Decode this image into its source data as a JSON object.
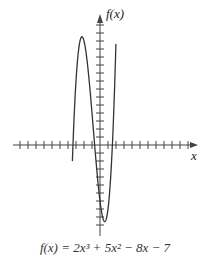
{
  "chart_data": {
    "type": "line",
    "title": "",
    "caption": "f(x) = 2x³ + 5x² − 8x − 7",
    "function": "2x^3 + 5x^2 - 8x - 7",
    "xlabel": "x",
    "ylabel": "f(x)",
    "xlim": [
      -11,
      12
    ],
    "ylim": [
      -11,
      16
    ],
    "tick_spacing_x": 1,
    "tick_spacing_y": 1,
    "tick_labels": false,
    "grid": false,
    "legend": null,
    "key_points": {
      "local_max": {
        "x": -2.26,
        "y": 13.5
      },
      "local_min": {
        "x": 0.59,
        "y": -9.57
      },
      "roots": [
        -3.38,
        -0.67,
        1.55
      ]
    },
    "series": [
      {
        "name": "f(x)",
        "color": "#333333",
        "x": [
          -3.6,
          -3.4,
          -3.0,
          -2.5,
          -2.26,
          -2.0,
          -1.5,
          -1.0,
          -0.5,
          0.0,
          0.5,
          0.59,
          1.0,
          1.5,
          1.9,
          2.0
        ],
        "y": [
          -5.43,
          -0.6,
          8.0,
          13.0,
          13.5,
          13.0,
          9.5,
          4.0,
          -2.5,
          -7.0,
          -9.5,
          -9.57,
          -8.0,
          -1.0,
          7.9,
          9.0
        ]
      }
    ]
  },
  "labels": {
    "y_axis": "f(x)",
    "x_axis": "x",
    "caption": "f(x) = 2x³ + 5x² − 8x − 7"
  },
  "colors": {
    "axis": "#444444",
    "curve": "#333333",
    "background": "#ffffff"
  }
}
